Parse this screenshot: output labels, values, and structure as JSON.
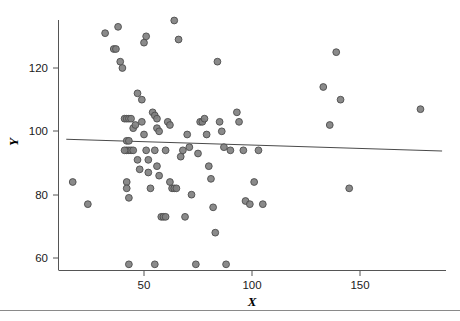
{
  "chart_data": {
    "type": "scatter",
    "title": "",
    "xlabel": "X",
    "ylabel": "Y",
    "xlim": [
      10,
      190
    ],
    "ylim": [
      54,
      138
    ],
    "xticks": [
      50,
      100,
      150
    ],
    "xtick_labels": [
      "50",
      "100",
      "150"
    ],
    "yticks": [
      60,
      80,
      100,
      120
    ],
    "ytick_labels": [
      "60",
      "80",
      "100",
      "120"
    ],
    "grid": false,
    "legend": null,
    "marker_color": "#808080",
    "marker_edge_color": "#4d4d4d",
    "line_color": "#4a4a4a",
    "axis_color": "#555555",
    "points": [
      [
        17,
        84
      ],
      [
        24,
        77
      ],
      [
        32,
        131
      ],
      [
        36,
        126
      ],
      [
        37,
        126
      ],
      [
        38,
        133
      ],
      [
        39,
        122
      ],
      [
        40,
        120
      ],
      [
        41,
        104
      ],
      [
        42,
        104
      ],
      [
        43,
        104
      ],
      [
        44,
        104
      ],
      [
        42,
        97
      ],
      [
        43,
        97
      ],
      [
        42,
        94
      ],
      [
        43,
        94
      ],
      [
        44,
        94
      ],
      [
        45,
        94
      ],
      [
        41,
        94
      ],
      [
        42,
        84
      ],
      [
        42,
        82
      ],
      [
        43,
        79
      ],
      [
        43,
        58
      ],
      [
        45,
        101
      ],
      [
        46,
        102
      ],
      [
        47,
        112
      ],
      [
        47,
        91
      ],
      [
        48,
        88
      ],
      [
        49,
        110
      ],
      [
        50,
        128
      ],
      [
        51,
        130
      ],
      [
        49,
        103
      ],
      [
        50,
        99
      ],
      [
        51,
        94
      ],
      [
        52,
        91
      ],
      [
        52,
        87
      ],
      [
        53,
        82
      ],
      [
        55,
        58
      ],
      [
        54,
        106
      ],
      [
        55,
        105
      ],
      [
        56,
        104
      ],
      [
        56,
        101
      ],
      [
        57,
        100
      ],
      [
        55,
        94
      ],
      [
        56,
        89
      ],
      [
        57,
        86
      ],
      [
        58,
        73
      ],
      [
        59,
        73
      ],
      [
        60,
        73
      ],
      [
        60,
        94
      ],
      [
        61,
        103
      ],
      [
        62,
        102
      ],
      [
        63,
        82
      ],
      [
        64,
        82
      ],
      [
        65,
        82
      ],
      [
        62,
        84
      ],
      [
        64,
        135
      ],
      [
        66,
        129
      ],
      [
        67,
        92
      ],
      [
        68,
        94
      ],
      [
        69,
        73
      ],
      [
        70,
        99
      ],
      [
        71,
        95
      ],
      [
        72,
        80
      ],
      [
        74,
        58
      ],
      [
        75,
        93
      ],
      [
        76,
        103
      ],
      [
        77,
        103
      ],
      [
        78,
        104
      ],
      [
        79,
        99
      ],
      [
        80,
        89
      ],
      [
        81,
        85
      ],
      [
        82,
        76
      ],
      [
        83,
        68
      ],
      [
        84,
        122
      ],
      [
        85,
        103
      ],
      [
        86,
        100
      ],
      [
        87,
        95
      ],
      [
        88,
        58
      ],
      [
        90,
        94
      ],
      [
        93,
        106
      ],
      [
        94,
        103
      ],
      [
        96,
        94
      ],
      [
        97,
        78
      ],
      [
        99,
        77
      ],
      [
        101,
        84
      ],
      [
        103,
        94
      ],
      [
        105,
        77
      ],
      [
        133,
        114
      ],
      [
        136,
        102
      ],
      [
        139,
        125
      ],
      [
        141,
        110
      ],
      [
        145,
        82
      ],
      [
        178,
        107
      ]
    ],
    "fit_line": {
      "x": [
        14,
        188
      ],
      "y": [
        97.5,
        93.8
      ],
      "description": "least-squares regression line"
    }
  }
}
